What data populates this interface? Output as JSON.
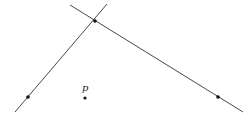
{
  "diagram": {
    "background": "#ffffff",
    "stroke_color": "#333333",
    "lines": [
      {
        "id": "line-1",
        "x1": 15,
        "y1": 112,
        "x2": 107,
        "y2": 4
      },
      {
        "id": "line-2",
        "x1": 70,
        "y1": 5,
        "x2": 243,
        "y2": 112
      }
    ],
    "points": [
      {
        "id": "intersection",
        "x": 95,
        "y": 21
      },
      {
        "id": "line-1-point",
        "x": 28,
        "y": 97
      },
      {
        "id": "line-2-point",
        "x": 218,
        "y": 97
      },
      {
        "id": "point-p",
        "x": 85,
        "y": 98
      }
    ],
    "labels": [
      {
        "id": "label-p",
        "text": "p",
        "x": 82,
        "y": 91
      }
    ]
  }
}
